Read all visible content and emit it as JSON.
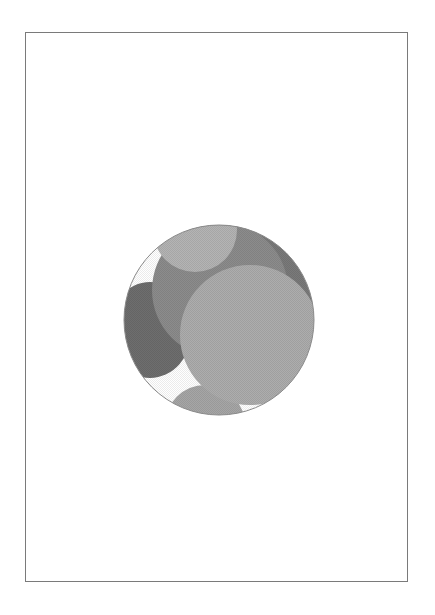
{
  "page": {
    "border_color": "#7a7a7a",
    "background": "#ffffff"
  },
  "figure": {
    "type": "overlapping-circles-illustration",
    "outer_circle": {
      "cx": 99,
      "cy": 100,
      "r": 95,
      "outline": "#8a8a8a"
    },
    "shapes": [
      {
        "name": "background-fill",
        "color": "#ffffff"
      },
      {
        "name": "dark-left-blob",
        "color": "#6e6e6e"
      },
      {
        "name": "upper-mid-gray-circle",
        "color": "#8c8c8c"
      },
      {
        "name": "top-right-dark-circle",
        "color": "#7a7a7a"
      },
      {
        "name": "top-light-circle",
        "color": "#b4b4b4"
      },
      {
        "name": "bottom-light-circle",
        "color": "#a6a6a6"
      },
      {
        "name": "large-light-circle",
        "color": "#adadad"
      }
    ]
  }
}
